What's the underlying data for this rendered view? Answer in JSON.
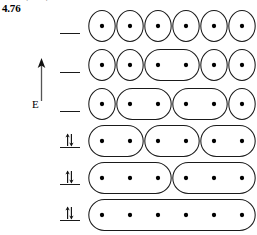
{
  "figure": {
    "number_label": "4.76",
    "clipped_header_text": "g   g",
    "axis": {
      "label": "E",
      "icon": "up-arrow-icon",
      "direction": "up",
      "meaning": "energy increases upward"
    }
  },
  "energy_levels": [
    {
      "index": 1,
      "occupancy": "empty",
      "electrons": 0,
      "spin_glyph": "",
      "y": 16
    },
    {
      "index": 2,
      "occupancy": "empty",
      "electrons": 0,
      "spin_glyph": "",
      "y": 55
    },
    {
      "index": 3,
      "occupancy": "empty",
      "electrons": 0,
      "spin_glyph": "",
      "y": 94
    },
    {
      "index": 4,
      "occupancy": "paired",
      "electrons": 2,
      "spin_glyph": "up-down-arrow-pair",
      "y": 130
    },
    {
      "index": 5,
      "occupancy": "paired",
      "electrons": 2,
      "spin_glyph": "up-down-arrow-pair",
      "y": 167
    },
    {
      "index": 6,
      "occupancy": "paired",
      "electrons": 2,
      "spin_glyph": "up-down-arrow-pair",
      "y": 203
    }
  ],
  "orbital_rows": [
    {
      "index": 1,
      "y": 8,
      "description": "six isolated one-centre orbitals",
      "groups": [
        1,
        1,
        1,
        1,
        1,
        1
      ]
    },
    {
      "index": 2,
      "y": 47,
      "description": "one two-centre orbital in the middle",
      "groups": [
        1,
        1,
        2,
        1,
        1
      ]
    },
    {
      "index": 3,
      "y": 86,
      "description": "two two-centre orbitals",
      "groups": [
        1,
        2,
        2,
        1
      ]
    },
    {
      "index": 4,
      "y": 123,
      "description": "three two-centre orbitals",
      "groups": [
        2,
        2,
        2
      ]
    },
    {
      "index": 5,
      "y": 160,
      "description": "two three-centre orbitals",
      "groups": [
        3,
        3
      ]
    },
    {
      "index": 6,
      "y": 197,
      "description": "one six-centre delocalised orbital",
      "groups": [
        6
      ]
    }
  ],
  "style": {
    "stroke": "#1a1a1a",
    "dot_color": "#000000",
    "background": "#ffffff"
  }
}
